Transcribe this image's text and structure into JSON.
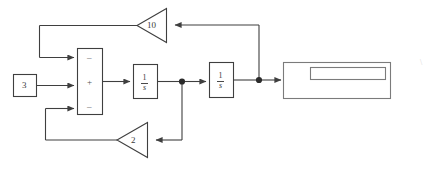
{
  "diagram": {
    "stroke_color": "#3f3f3f",
    "background": "#ffffff",
    "source_block": {
      "label": "3"
    },
    "summing_junction": {
      "signs": [
        {
          "name": "minus-top",
          "symbol": "–"
        },
        {
          "name": "plus-middle",
          "symbol": "+"
        },
        {
          "name": "minus-bottom",
          "symbol": "–"
        }
      ]
    },
    "integrator_1": {
      "numerator": "1",
      "denominator": "s"
    },
    "integrator_2": {
      "numerator": "1",
      "denominator": "s"
    },
    "gain_outer": {
      "label": "10"
    },
    "gain_inner": {
      "label": "2"
    },
    "output_block": {
      "label": ""
    },
    "stray_mark": {
      "label": "\\"
    }
  }
}
